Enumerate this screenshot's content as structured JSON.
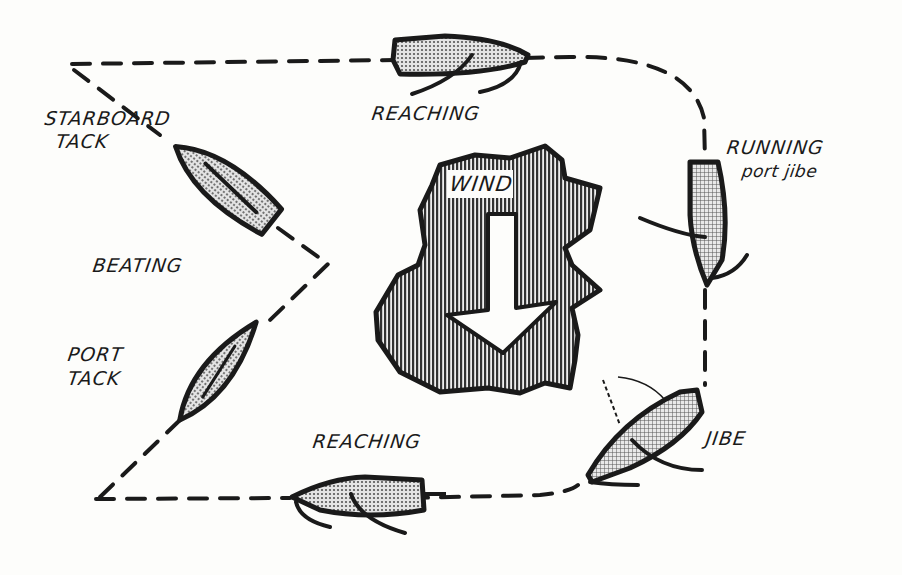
{
  "diagram": {
    "colors": {
      "background": "#fdfdfb",
      "ink": "#1a1a1a",
      "boat_fill": "#bdbdbd",
      "wind_fill": "#7a7a7a"
    },
    "wind": {
      "label": "WIND",
      "direction": "down",
      "icon": "wind-arrow-icon"
    },
    "labels": {
      "starboard_tack_1": "STARBOARD",
      "starboard_tack_2": "TACK",
      "beating": "BEATING",
      "port_tack_1": "PORT",
      "port_tack_2": "TACK",
      "reaching_top": "REACHING",
      "reaching_bottom": "REACHING",
      "running_1": "RUNNING",
      "running_2": "port jibe",
      "jibe": "JIBE"
    },
    "boats": [
      {
        "name": "starboard-tack-boat",
        "point": "beating"
      },
      {
        "name": "port-tack-boat",
        "point": "beating"
      },
      {
        "name": "reaching-top-boat",
        "point": "reaching"
      },
      {
        "name": "running-boat",
        "point": "running"
      },
      {
        "name": "jibe-boat",
        "point": "jibe"
      },
      {
        "name": "reaching-bottom-boat",
        "point": "reaching"
      }
    ]
  }
}
